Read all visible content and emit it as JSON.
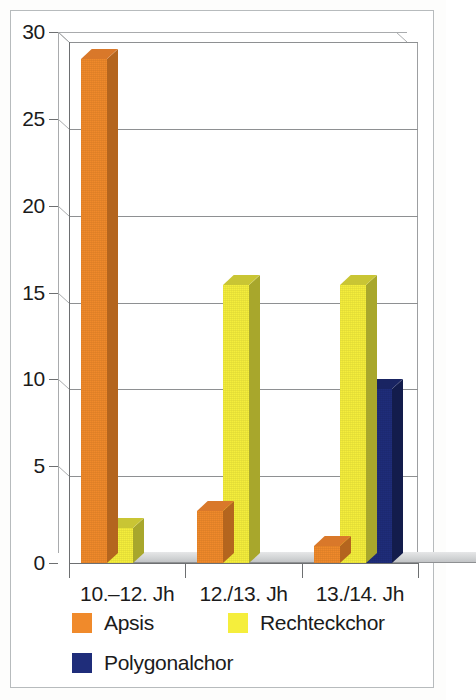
{
  "chart_data": {
    "type": "bar",
    "title": "",
    "subtitle": "",
    "xlabel": "",
    "ylabel": "",
    "categories": [
      "10.–12. Jh",
      "12./13. Jh",
      "13./14. Jh"
    ],
    "series": [
      {
        "name": "Apsis",
        "color": "#F08A2B",
        "values": [
          29,
          3,
          1
        ]
      },
      {
        "name": "Rechteckchor",
        "color": "#F5EE3C",
        "values": [
          2,
          16,
          16
        ]
      },
      {
        "name": "Polygonalchor",
        "color": "#1F2D7A",
        "values": [
          0,
          0,
          10
        ]
      }
    ],
    "ylim": [
      0,
      30
    ],
    "yticks": [
      0,
      5,
      10,
      15,
      20,
      25,
      30
    ],
    "ytick_labels": [
      "0",
      "5",
      "10",
      "15",
      "20",
      "25",
      "30"
    ],
    "grid": true,
    "grid_axis": "y",
    "legend_position": "bottom",
    "style": "3d-column",
    "background": "#FFFFFF",
    "frame_color": "#B9BCBE",
    "axis_color": "#6D6F71",
    "grid_color": "#8E9092",
    "text_color": "#1B1B1B"
  },
  "legend": {
    "entries": [
      {
        "label": "Apsis",
        "color": "#F08A2B"
      },
      {
        "label": "Rechteckchor",
        "color": "#F5EE3C"
      },
      {
        "label": "Polygonalchor",
        "color": "#1F2D7A"
      }
    ]
  }
}
